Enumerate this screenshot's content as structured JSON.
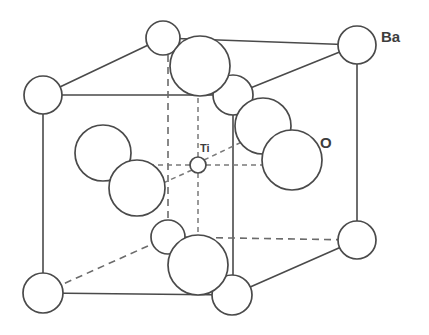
{
  "figure": {
    "type": "crystal-structure-diagram",
    "background_color": "#ffffff",
    "line_color": "#4a4a4a",
    "dashed_line_color": "#6b6b6b",
    "atom_fill_color": "#ffffff",
    "label_color": "#3d3d3d"
  },
  "labels": {
    "ba": "Ba",
    "o": "O",
    "ti": "Ti"
  },
  "label_positions": {
    "ba": {
      "x": 381,
      "y": 42
    },
    "o": {
      "x": 320,
      "y": 148
    },
    "ti": {
      "x": 200,
      "y": 152
    }
  },
  "atoms": {
    "barium": [
      {
        "id": "ba-back-top-left",
        "cx": 163,
        "cy": 38,
        "r": 17
      },
      {
        "id": "ba-back-top-right",
        "cx": 357,
        "cy": 45,
        "r": 19
      },
      {
        "id": "ba-front-top-left",
        "cx": 43,
        "cy": 95,
        "r": 19
      },
      {
        "id": "ba-front-top-right",
        "cx": 233,
        "cy": 95,
        "r": 20
      },
      {
        "id": "ba-back-bottom-left",
        "cx": 168,
        "cy": 237,
        "r": 17
      },
      {
        "id": "ba-back-bottom-right",
        "cx": 357,
        "cy": 240,
        "r": 19
      },
      {
        "id": "ba-front-bottom-left",
        "cx": 43,
        "cy": 293,
        "r": 20
      },
      {
        "id": "ba-front-bottom-right",
        "cx": 232,
        "cy": 295,
        "r": 20
      }
    ],
    "oxygen": [
      {
        "id": "o-top",
        "cx": 200,
        "cy": 66,
        "r": 30
      },
      {
        "id": "o-right-back",
        "cx": 263,
        "cy": 126,
        "r": 28
      },
      {
        "id": "o-right-front",
        "cx": 292,
        "cy": 160,
        "r": 30
      },
      {
        "id": "o-left-back",
        "cx": 103,
        "cy": 153,
        "r": 28
      },
      {
        "id": "o-left-front",
        "cx": 137,
        "cy": 188,
        "r": 28
      },
      {
        "id": "o-bottom",
        "cx": 198,
        "cy": 265,
        "r": 30
      }
    ],
    "titanium": [
      {
        "id": "ti-center",
        "cx": 198,
        "cy": 165,
        "r": 8
      }
    ]
  },
  "cell_edges": {
    "solid": [
      {
        "id": "edge-top-front",
        "x1": 43,
        "y1": 95,
        "x2": 233,
        "y2": 95
      },
      {
        "id": "edge-top-left-diag",
        "x1": 43,
        "y1": 95,
        "x2": 163,
        "y2": 38
      },
      {
        "id": "edge-top-back",
        "x1": 163,
        "y1": 38,
        "x2": 357,
        "y2": 45
      },
      {
        "id": "edge-top-right-diag",
        "x1": 233,
        "y1": 95,
        "x2": 357,
        "y2": 45
      },
      {
        "id": "edge-vert-front-left",
        "x1": 43,
        "y1": 114,
        "x2": 43,
        "y2": 273
      },
      {
        "id": "edge-vert-front-right",
        "x1": 233,
        "y1": 110,
        "x2": 233,
        "y2": 275
      },
      {
        "id": "edge-vert-back-right",
        "x1": 357,
        "y1": 64,
        "x2": 357,
        "y2": 221
      },
      {
        "id": "edge-bottom-front",
        "x1": 43,
        "y1": 293,
        "x2": 232,
        "y2": 295
      },
      {
        "id": "edge-bottom-right-diag",
        "x1": 232,
        "y1": 295,
        "x2": 357,
        "y2": 240
      }
    ],
    "dashed": [
      {
        "id": "edge-vert-back-left",
        "x1": 168,
        "y1": 55,
        "x2": 168,
        "y2": 220
      },
      {
        "id": "edge-bottom-back",
        "x1": 168,
        "y1": 237,
        "x2": 357,
        "y2": 240
      },
      {
        "id": "edge-bottom-left-diag",
        "x1": 43,
        "y1": 293,
        "x2": 168,
        "y2": 237
      }
    ]
  },
  "ti_bonds": [
    {
      "id": "ti-bond-left",
      "x1": 190,
      "y1": 165,
      "x2": 122,
      "y2": 165
    },
    {
      "id": "ti-bond-right",
      "x1": 206,
      "y1": 165,
      "x2": 272,
      "y2": 165
    },
    {
      "id": "ti-bond-up",
      "x1": 198,
      "y1": 157,
      "x2": 198,
      "y2": 96
    },
    {
      "id": "ti-bond-down",
      "x1": 198,
      "y1": 173,
      "x2": 198,
      "y2": 236
    },
    {
      "id": "ti-bond-diag-upright",
      "x1": 204,
      "y1": 160,
      "x2": 248,
      "y2": 139
    },
    {
      "id": "ti-bond-diag-downleft",
      "x1": 192,
      "y1": 170,
      "x2": 152,
      "y2": 188
    }
  ]
}
